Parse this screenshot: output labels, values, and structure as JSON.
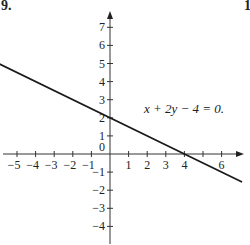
{
  "page": {
    "problem_number": "9.",
    "next_problem_number": "1"
  },
  "chart_data": {
    "type": "line",
    "title": "",
    "xlabel": "",
    "ylabel": "",
    "xlim": [
      -5.9,
      7.1
    ],
    "ylim": [
      -4.6,
      7.9
    ],
    "grid": false,
    "x_ticks": [
      -5,
      -4,
      -3,
      -2,
      -1,
      1,
      2,
      3,
      4,
      6
    ],
    "x_tick_marks": [
      -5,
      -4,
      -3,
      -2,
      -1,
      1,
      2,
      3,
      4,
      5,
      6
    ],
    "y_ticks": [
      7,
      6,
      5,
      4,
      3,
      2,
      1,
      0,
      -1,
      -2,
      -3,
      -4
    ],
    "origin_label": "0",
    "annotation": "x + 2y − 4 = 0.",
    "series": [
      {
        "name": "x + 2y − 4 = 0",
        "x": [
          -6,
          4,
          7.1
        ],
        "y": [
          5,
          0,
          -1.55
        ]
      }
    ],
    "key_points": [
      {
        "label": "y-intercept",
        "x": 0,
        "y": 2
      },
      {
        "label": "x-intercept",
        "x": 4,
        "y": 0
      }
    ]
  }
}
